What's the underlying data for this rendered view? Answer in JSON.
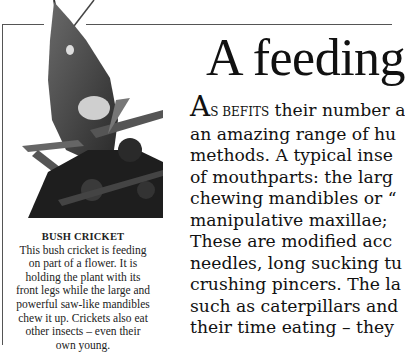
{
  "article": {
    "headline": "A feeding",
    "dropcap_letter": "A",
    "smallcaps_lead": "S BEFITS",
    "body_lines": [
      " their number a",
      "an amazing range of hu",
      "methods. A typical inse",
      "of mouthparts: the larg",
      "chewing mandibles or “",
      "manipulative maxillae;",
      "These are modified acc",
      "needles, long sucking tu",
      "crushing pincers. The la",
      "such as caterpillars and",
      "their time eating – they"
    ]
  },
  "figure": {
    "caption_title": "BUSH CRICKET",
    "caption_lines": [
      "This bush cricket is feeding",
      "on part of a flower. It is",
      "holding the plant with its",
      "front legs while the large and",
      "powerful saw-like mandibles",
      "chew it up. Crickets also eat",
      "other insects – even their",
      "own young."
    ]
  }
}
